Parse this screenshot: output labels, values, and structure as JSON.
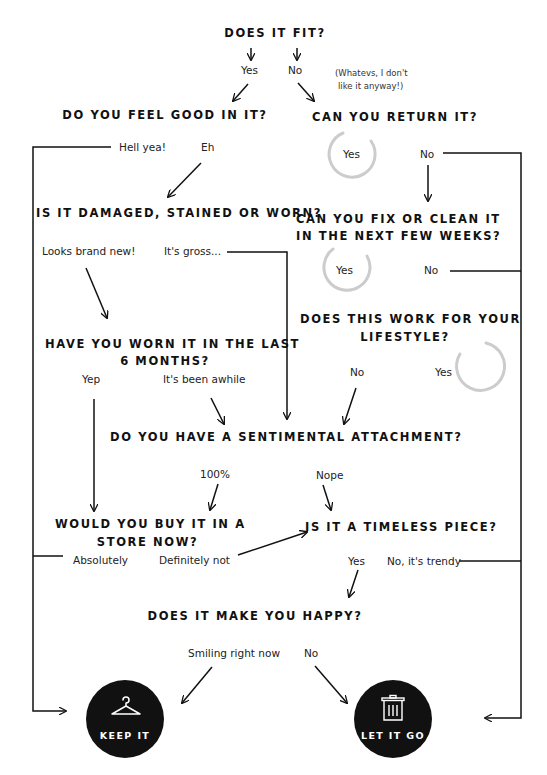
{
  "diagram": {
    "type": "flowchart",
    "colors": {
      "ink": "#111111",
      "circle_ring": "#cccccc",
      "outcome_fill": "#111111",
      "outcome_text": "#ffffff",
      "background": "#ffffff"
    },
    "questions": {
      "fit": "DOES IT FIT?",
      "feel_good": "DO YOU FEEL GOOD IN IT?",
      "return": "CAN YOU RETURN IT?",
      "damaged": "IS IT DAMAGED, STAINED OR WORN?",
      "fix_line1": "CAN YOU FIX OR CLEAN IT",
      "fix_line2": "IN THE NEXT FEW WEEKS?",
      "lifestyle_line1": "DOES THIS WORK FOR YOUR",
      "lifestyle_line2": "LIFESTYLE?",
      "worn_line1": "HAVE YOU WORN IT IN THE LAST",
      "worn_line2": "6 MONTHS?",
      "sentimental": "DO YOU HAVE A SENTIMENTAL ATTACHMENT?",
      "buy_line1": "WOULD YOU BUY IT IN A",
      "buy_line2": "STORE NOW?",
      "timeless": "IS IT A TIMELESS PIECE?",
      "happy": "DOES IT MAKE YOU HAPPY?"
    },
    "answers": {
      "fit_yes": "Yes",
      "fit_no": "No",
      "fit_note_line1": "(Whatevs, I don't",
      "fit_note_line2": "like it anyway!)",
      "feel_hell_yea": "Hell yea!",
      "feel_eh": "Eh",
      "return_yes": "Yes",
      "return_no": "No",
      "damaged_new": "Looks brand new!",
      "damaged_gross": "It's gross...",
      "fix_yes": "Yes",
      "fix_no": "No",
      "lifestyle_no": "No",
      "lifestyle_yes": "Yes",
      "worn_yep": "Yep",
      "worn_awhile": "It's been awhile",
      "sentimental_yes": "100%",
      "sentimental_nope": "Nope",
      "buy_absolutely": "Absolutely",
      "buy_definitely_not": "Definitely not",
      "timeless_yes": "Yes",
      "timeless_trendy": "No, it's trendy",
      "happy_smiling": "Smiling right now",
      "happy_no": "No"
    },
    "outcomes": {
      "keep": {
        "label": "KEEP IT",
        "icon": "hanger-icon"
      },
      "let_go": {
        "label": "LET IT GO",
        "icon": "trash-can-icon"
      }
    }
  }
}
